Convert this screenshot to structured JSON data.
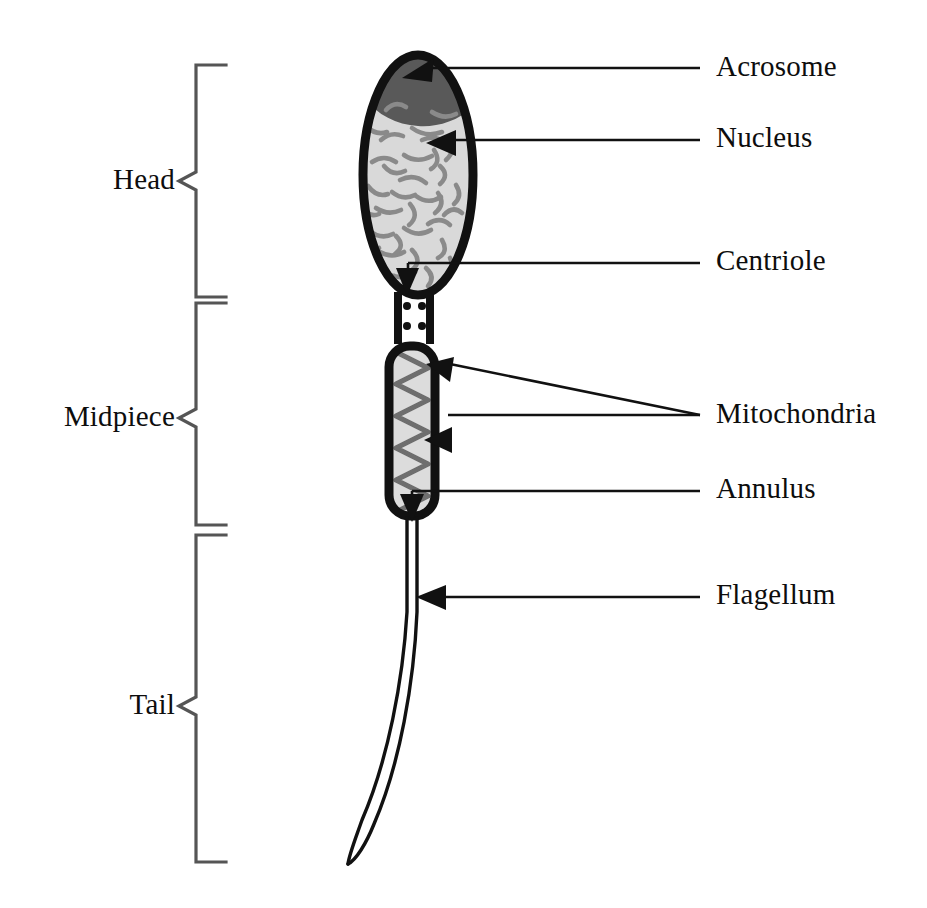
{
  "figure": {
    "background_color": "#ffffff",
    "ink_color": "#0d0d0d"
  },
  "colors": {
    "outline": "#111111",
    "acrosome_fill": "#595959",
    "nucleus_fill": "#d9d9d9",
    "midpiece_fill": "#dcdcdc",
    "chromatin": "#8a8a8a",
    "mitochondria_coil": "#6e6e6e",
    "bracket": "#555555",
    "leader_line": "#111111"
  },
  "region_brackets": [
    {
      "id": "head",
      "label": "Head",
      "label_x": 92,
      "label_y": 163,
      "tip_y": 181,
      "top_y": 65,
      "bottom_y": 297
    },
    {
      "id": "midpiece",
      "label": "Midpiece",
      "label_x": 35,
      "label_y": 400,
      "tip_y": 418,
      "top_y": 303,
      "bottom_y": 525
    },
    {
      "id": "tail",
      "label": "Tail",
      "label_x": 110,
      "label_y": 688,
      "tip_y": 706,
      "top_y": 535,
      "bottom_y": 862
    }
  ],
  "callouts": [
    {
      "id": "acrosome",
      "label": "Acrosome",
      "label_x": 716,
      "label_y": 50,
      "line_y": 68,
      "line_x_start": 700,
      "line_x_end": 432,
      "arrow_x": 410,
      "arrow_y": 70,
      "arrow_dir": "left-down"
    },
    {
      "id": "nucleus",
      "label": "Nucleus",
      "label_x": 716,
      "label_y": 121,
      "line_y": 140,
      "line_x_start": 700,
      "line_x_end": 452,
      "arrow_x": 430,
      "arrow_y": 143,
      "arrow_dir": "left"
    },
    {
      "id": "centriole",
      "label": "Centriole",
      "label_x": 716,
      "label_y": 244,
      "line_y": 263,
      "line_x_start": 700,
      "line_x_end": 408,
      "arrow_x": 406,
      "arrow_y": 288,
      "arrow_dir": "down"
    },
    {
      "id": "mitochondria",
      "label": "Mitochondria",
      "label_x": 716,
      "label_y": 397,
      "line_y": 415,
      "line_x_start": 700,
      "line_x_end": 440,
      "arrow_x": 430,
      "arrow_y": 438,
      "arrow_dir": "left"
    },
    {
      "id": "annulus",
      "label": "Annulus",
      "label_x": 716,
      "label_y": 472,
      "line_y": 491,
      "line_x_start": 700,
      "line_x_end": 412,
      "arrow_x": 411,
      "arrow_y": 515,
      "arrow_dir": "down"
    },
    {
      "id": "flagellum",
      "label": "Flagellum",
      "label_x": 716,
      "label_y": 578,
      "line_y": 597,
      "line_x_start": 700,
      "line_x_end": 440,
      "arrow_x": 420,
      "arrow_y": 597,
      "arrow_dir": "left"
    }
  ],
  "mitochondria_extra_leader": {
    "id": "mitochondria-upper-branch",
    "from_x": 700,
    "from_y": 415,
    "to_x": 448,
    "to_y": 368,
    "arrow_x": 432,
    "arrow_y": 365
  },
  "anatomy": {
    "head": {
      "name": "sperm-head",
      "center_x": 418,
      "center_y": 175,
      "radius_x": 60,
      "radius_y": 125,
      "outline_width": 9
    },
    "acrosome": {
      "name": "acrosome-cap",
      "description": "dark grey cap covering the anterior third of the head"
    },
    "nucleus": {
      "name": "nucleus",
      "description": "light grey interior filled with short dark chromatin squiggles",
      "chromatin_marks": 34
    },
    "neck": {
      "name": "neck-connecting-piece",
      "x": 398,
      "y": 296,
      "width": 30,
      "height": 48,
      "centriole_dots": 4
    },
    "midpiece": {
      "name": "midpiece-capsule",
      "x": 383,
      "y": 340,
      "width": 58,
      "height": 182,
      "corner_radius": 26,
      "outline_width": 9,
      "coil_turns": 11
    },
    "flagellum": {
      "name": "flagellum-tail",
      "start_x": 412,
      "start_y": 520,
      "end_x": 352,
      "end_y": 868,
      "tube_width": 9
    }
  }
}
